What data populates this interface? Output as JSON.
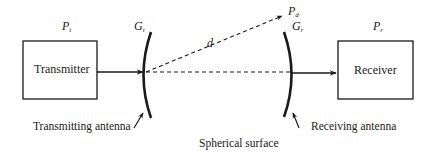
{
  "diagram": {
    "type": "block-diagram",
    "nodes": {
      "transmitter": {
        "label": "Transmitter",
        "power_symbol": "P",
        "power_sub": "t"
      },
      "receiver": {
        "label": "Receiver",
        "power_symbol": "P",
        "power_sub": "r"
      }
    },
    "antennas": {
      "transmitting": {
        "label": "Transmitting antenna",
        "gain_symbol": "G",
        "gain_sub": "t"
      },
      "receiving": {
        "label": "Receiving antenna",
        "gain_symbol": "G",
        "gain_sub": "r"
      }
    },
    "annotations": {
      "distance": "d",
      "power_density_symbol": "P",
      "power_density_sub": "d",
      "surface": "Spherical surface"
    },
    "edges": [
      {
        "from": "transmitter",
        "to": "transmitting antenna",
        "style": "solid arrow"
      },
      {
        "from": "transmitting antenna",
        "to": "receiving antenna",
        "style": "dashed line"
      },
      {
        "from": "transmitting antenna",
        "to": "P_d",
        "style": "dashed arrow",
        "label": "d"
      },
      {
        "from": "receiving antenna",
        "to": "receiver",
        "style": "solid arrow"
      }
    ],
    "colors": {
      "line": "#1a1a1a",
      "background": "#ffffff"
    }
  }
}
